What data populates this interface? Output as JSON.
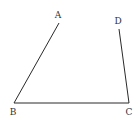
{
  "diagram": {
    "type": "geometry-figure",
    "stroke_color": "#2a2a2a",
    "label_color": "#333333",
    "points": {
      "A": {
        "label": "A",
        "x": 59,
        "y": 23,
        "label_x": 58,
        "label_y": 18
      },
      "B": {
        "label": "B",
        "x": 14,
        "y": 103,
        "label_x": 13,
        "label_y": 115
      },
      "C": {
        "label": "C",
        "x": 129,
        "y": 103,
        "label_x": 129,
        "label_y": 115
      },
      "D": {
        "label": "D",
        "x": 119,
        "y": 29,
        "label_x": 118,
        "label_y": 24
      }
    },
    "segments": [
      {
        "from": "A",
        "to": "B"
      },
      {
        "from": "B",
        "to": "C"
      },
      {
        "from": "C",
        "to": "D"
      }
    ]
  }
}
